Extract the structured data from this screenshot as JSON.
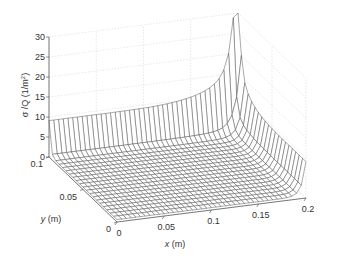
{
  "chart_data": {
    "type": "surface",
    "title": "",
    "xlabel": "x (m)",
    "ylabel": "y (m)",
    "zlabel": "σ /Q (1/m²)",
    "xlim": [
      0,
      0.2
    ],
    "ylim": [
      0,
      0.1
    ],
    "zlim": [
      0,
      30
    ],
    "xticks": [
      "0",
      "0.05",
      "0.1",
      "0.15",
      "0.2"
    ],
    "yticks": [
      "0",
      "0.05",
      "0.1"
    ],
    "zticks": [
      "0",
      "5",
      "10",
      "15",
      "20",
      "25",
      "30"
    ],
    "grid": true,
    "mesh": {
      "nx": 40,
      "ny": 20
    },
    "features": {
      "floor_level": 0.6,
      "edge_wall_y_max": 8.5,
      "edge_wall_x_max": 8.5,
      "corner_peak": {
        "x": 0.2,
        "y": 0.1,
        "z": 30
      }
    },
    "colors": {
      "mesh": "#555555",
      "grid": "#d8d8d8",
      "axis": "#444444"
    }
  },
  "axes": {
    "zlabel_main": "σ /Q (1/m",
    "zlabel_sup": "2",
    "zlabel_end": ")",
    "xlabel_italic": "x",
    "xlabel_unit": " (m)",
    "ylabel_italic": "y",
    "ylabel_unit": " (m)"
  }
}
